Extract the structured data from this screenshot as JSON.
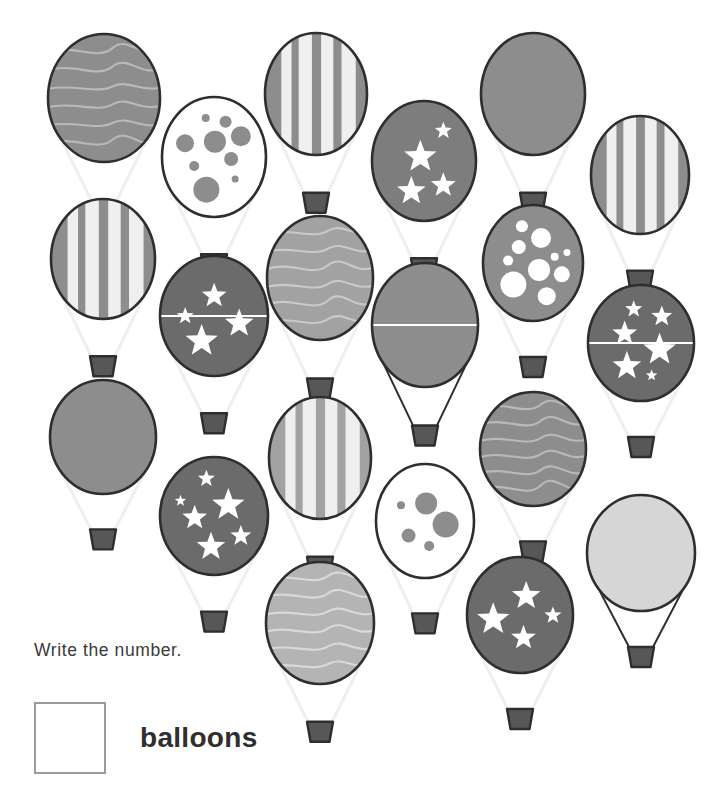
{
  "worksheet": {
    "prompt": "Write the number.",
    "answer_label": "balloons",
    "answer_value": "",
    "total_balloons": 20
  },
  "palette": {
    "outline": "#2e2e2e",
    "basket_fill": "#575757",
    "basket_stroke": "#2e2e2e",
    "rope_light": "#efefef",
    "rope_dark": "#2e2e2e",
    "white": "#ffffff",
    "gray_dark": "#6b6b6b",
    "gray_medium": "#8d8d8d",
    "gray_light": "#b4b4b4",
    "gray_pale": "#d6d6d6",
    "line_light": "#c9c9c9",
    "box_border": "#9a9a9a",
    "text": "#3a3a3a"
  },
  "balloons": [
    {
      "id": 1,
      "name": "balloon-wavy-dark",
      "pattern": "wavy",
      "cx": 104,
      "cy": 98,
      "rx": 56,
      "ry": 64,
      "fill": "#8d8d8d",
      "accent": "#b9b9b9",
      "rope": "light"
    },
    {
      "id": 2,
      "name": "balloon-dots-on-white",
      "pattern": "dots",
      "cx": 214,
      "cy": 157,
      "rx": 52,
      "ry": 60,
      "fill": "#ffffff",
      "accent": "#8d8d8d",
      "rope": "light"
    },
    {
      "id": 3,
      "name": "balloon-stripes-top",
      "pattern": "stripes",
      "cx": 316,
      "cy": 94,
      "rx": 51,
      "ry": 61,
      "fill": "#8d8d8d",
      "accent": "#efefef",
      "rope": "light"
    },
    {
      "id": 4,
      "name": "balloon-stars-top",
      "pattern": "stars",
      "cx": 424,
      "cy": 161,
      "rx": 52,
      "ry": 60,
      "fill": "#7d7d7d",
      "accent": "#ffffff",
      "rope": "light"
    },
    {
      "id": 5,
      "name": "balloon-plain-medium-top",
      "pattern": "plain",
      "cx": 533,
      "cy": 94,
      "rx": 52,
      "ry": 61,
      "fill": "#8d8d8d",
      "accent": "#8d8d8d",
      "rope": "light"
    },
    {
      "id": 6,
      "name": "balloon-stripes-right",
      "pattern": "stripes",
      "cx": 640,
      "cy": 175,
      "rx": 49,
      "ry": 59,
      "fill": "#8d8d8d",
      "accent": "#efefef",
      "rope": "light"
    },
    {
      "id": 7,
      "name": "balloon-stripes-left",
      "pattern": "stripes",
      "cx": 103,
      "cy": 259,
      "rx": 52,
      "ry": 60,
      "fill": "#8d8d8d",
      "accent": "#efefef",
      "rope": "light"
    },
    {
      "id": 8,
      "name": "balloon-stars-upper-left",
      "pattern": "stars",
      "cx": 214,
      "cy": 316,
      "rx": 54,
      "ry": 60,
      "fill": "#6b6b6b",
      "accent": "#ffffff",
      "rope": "light",
      "band": true
    },
    {
      "id": 9,
      "name": "balloon-wavy-medium-mid",
      "pattern": "wavy",
      "cx": 320,
      "cy": 278,
      "rx": 53,
      "ry": 62,
      "fill": "#a2a2a2",
      "accent": "#c9c9c9",
      "rope": "light"
    },
    {
      "id": 10,
      "name": "balloon-plain-split",
      "pattern": "plain",
      "cx": 425,
      "cy": 325,
      "rx": 53,
      "ry": 62,
      "fill": "#8d8d8d",
      "accent": "#8d8d8d",
      "rope": "dark",
      "band": true
    },
    {
      "id": 11,
      "name": "balloon-dots-on-gray",
      "pattern": "dots",
      "cx": 533,
      "cy": 263,
      "rx": 50,
      "ry": 58,
      "fill": "#8d8d8d",
      "accent": "#ffffff",
      "rope": "light"
    },
    {
      "id": 12,
      "name": "balloon-stars-right-mid",
      "pattern": "stars",
      "cx": 641,
      "cy": 343,
      "rx": 53,
      "ry": 58,
      "fill": "#6b6b6b",
      "accent": "#ffffff",
      "rope": "light",
      "band": true
    },
    {
      "id": 13,
      "name": "balloon-plain-medium-left",
      "pattern": "plain",
      "cx": 103,
      "cy": 437,
      "rx": 53,
      "ry": 57,
      "fill": "#8d8d8d",
      "accent": "#8d8d8d",
      "rope": "light"
    },
    {
      "id": 14,
      "name": "balloon-stars-lower-left",
      "pattern": "stars",
      "cx": 214,
      "cy": 516,
      "rx": 54,
      "ry": 59,
      "fill": "#6b6b6b",
      "accent": "#ffffff",
      "rope": "light"
    },
    {
      "id": 15,
      "name": "balloon-stripes-mid-low",
      "pattern": "stripes",
      "cx": 320,
      "cy": 458,
      "rx": 51,
      "ry": 61,
      "fill": "#a2a2a2",
      "accent": "#efefef",
      "rope": "light"
    },
    {
      "id": 16,
      "name": "balloon-dots-lower-mid",
      "pattern": "dots",
      "cx": 425,
      "cy": 521,
      "rx": 49,
      "ry": 57,
      "fill": "#ffffff",
      "accent": "#8d8d8d",
      "rope": "light"
    },
    {
      "id": 17,
      "name": "balloon-wavy-right-low",
      "pattern": "wavy",
      "cx": 533,
      "cy": 449,
      "rx": 53,
      "ry": 57,
      "fill": "#8d8d8d",
      "accent": "#b9b9b9",
      "rope": "light"
    },
    {
      "id": 18,
      "name": "balloon-plain-pale",
      "pattern": "plain",
      "cx": 641,
      "cy": 553,
      "rx": 54,
      "ry": 58,
      "fill": "#d6d6d6",
      "accent": "#d6d6d6",
      "rope": "dark"
    },
    {
      "id": 19,
      "name": "balloon-wavy-light-bottom",
      "pattern": "wavy",
      "cx": 320,
      "cy": 623,
      "rx": 54,
      "ry": 61,
      "fill": "#b4b4b4",
      "accent": "#d9d9d9",
      "rope": "light"
    },
    {
      "id": 20,
      "name": "balloon-stars-bottom",
      "pattern": "stars",
      "cx": 520,
      "cy": 615,
      "rx": 53,
      "ry": 58,
      "fill": "#6b6b6b",
      "accent": "#ffffff",
      "rope": "light"
    }
  ]
}
